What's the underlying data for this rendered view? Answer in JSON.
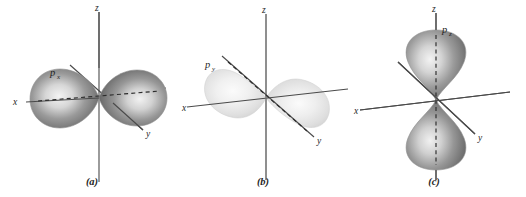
{
  "figure": {
    "background_color": "#ffffff",
    "panel_count": 3
  },
  "colors": {
    "axis": "#4a4a4a",
    "axis_soft": "#6e6e6e",
    "dashed_nodal": "#2c2c2c",
    "dashed_nodal_soft": "#8c8c8c",
    "text": "#1f1f1f",
    "lobe_dark_mid": "#7e7e7e",
    "lobe_dark_edge": "#5c5c5c",
    "lobe_highlight": "#f2f2f2",
    "lobe_light_mid": "#e3e3e3",
    "lobe_light_edge": "#cfcfcf"
  },
  "panels": [
    {
      "id": "a",
      "caption": "(a)",
      "orbital_label": "p",
      "orbital_subscript": "x",
      "orbital_label_full": "px",
      "lobe_axis": "x",
      "lobe_shading": "dark",
      "nodal_line_visible": true,
      "axes": [
        {
          "name": "x",
          "label": "x"
        },
        {
          "name": "y",
          "label": "y"
        },
        {
          "name": "z",
          "label": "z"
        }
      ]
    },
    {
      "id": "b",
      "caption": "(b)",
      "orbital_label": "p",
      "orbital_subscript": "y",
      "orbital_label_full": "py",
      "lobe_axis": "y",
      "lobe_shading": "light",
      "nodal_line_visible": true,
      "axes": [
        {
          "name": "x",
          "label": "x"
        },
        {
          "name": "y",
          "label": "y"
        },
        {
          "name": "z",
          "label": "z"
        }
      ]
    },
    {
      "id": "c",
      "caption": "(c)",
      "orbital_label": "p",
      "orbital_subscript": "z",
      "orbital_label_full": "pz",
      "lobe_axis": "z",
      "lobe_shading": "dark",
      "nodal_line_visible": true,
      "axes": [
        {
          "name": "x",
          "label": "x"
        },
        {
          "name": "y",
          "label": "y"
        },
        {
          "name": "z",
          "label": "z"
        }
      ]
    }
  ]
}
